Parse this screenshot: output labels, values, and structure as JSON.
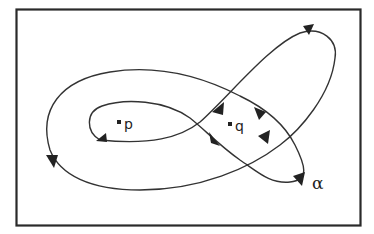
{
  "diagram": {
    "type": "oriented closed curve in rectangle",
    "frame": {
      "stroke": "#2a2a2a"
    },
    "curve": {
      "name": "α",
      "stroke": "#333333"
    },
    "points": [
      {
        "label": "p"
      },
      {
        "label": "q"
      }
    ],
    "curve_label": "α"
  }
}
